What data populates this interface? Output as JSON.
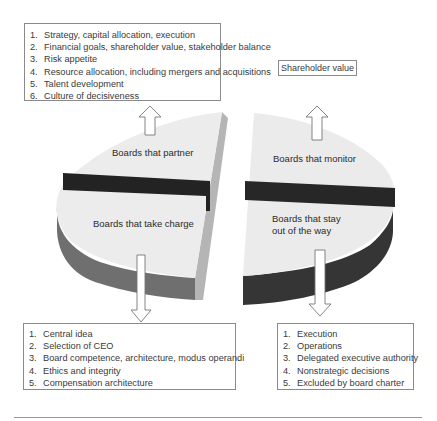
{
  "segments": {
    "partner": "Boards that partner",
    "monitor": "Boards that monitor",
    "take_charge": "Boards that take charge",
    "stay_out_line1": "Boards that stay",
    "stay_out_line2": "out of the way"
  },
  "callouts": {
    "partner": {
      "items": [
        {
          "num": "1.",
          "text": "Strategy, capital allocation, execution"
        },
        {
          "num": "2.",
          "text": "Financial goals, shareholder value, stakeholder balance"
        },
        {
          "num": "3.",
          "text": "Risk appetite"
        },
        {
          "num": "4.",
          "text": "Resource allocation, including mergers and acquisitions"
        },
        {
          "num": "5.",
          "text": "Talent development"
        },
        {
          "num": "6.",
          "text": "Culture of decisiveness"
        }
      ]
    },
    "monitor": {
      "label": "Shareholder value"
    },
    "take_charge": {
      "items": [
        {
          "num": "1.",
          "text": "Central idea"
        },
        {
          "num": "2.",
          "text": "Selection of CEO"
        },
        {
          "num": "3.",
          "text": "Board competence, architecture, modus operandi"
        },
        {
          "num": "4.",
          "text": "Ethics and integrity"
        },
        {
          "num": "5.",
          "text": "Compensation architecture"
        }
      ]
    },
    "stay_out": {
      "items": [
        {
          "num": "1.",
          "text": "Execution"
        },
        {
          "num": "2.",
          "text": "Operations"
        },
        {
          "num": "3.",
          "text": "Delegated executive authority"
        },
        {
          "num": "4.",
          "text": "Nonstrategic decisions"
        },
        {
          "num": "5.",
          "text": "Excluded by board charter"
        }
      ]
    }
  },
  "colors": {
    "top_face": "#ededed",
    "left_side": "#6e6e6e",
    "right_side": "#3a3a3a",
    "band": "#262626",
    "border": "#8a8a8a"
  }
}
